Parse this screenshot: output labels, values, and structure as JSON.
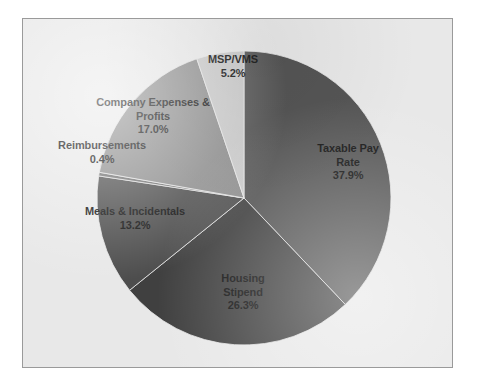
{
  "chart_data": {
    "type": "pie",
    "title": "",
    "subtitle": "",
    "xlabel": "",
    "ylabel": "",
    "legend_position": "none",
    "grid": false,
    "labels_inside": true,
    "start_angle_deg": 0,
    "direction": "clockwise",
    "categories": [
      "Taxable Pay Rate",
      "Housing Stipend",
      "Meals & Incidentals",
      "Reimbursements",
      "Company Expenses & Profits",
      "MSP/VMS"
    ],
    "values": [
      37.9,
      26.3,
      13.2,
      0.4,
      17.0,
      5.2
    ],
    "units": "percent",
    "slices": [
      {
        "name": "Taxable Pay Rate",
        "label_lines": [
          "Taxable Pay",
          "Rate"
        ],
        "value": 37.9,
        "value_text": "37.9%",
        "color": "#555555"
      },
      {
        "name": "Housing Stipend",
        "label_lines": [
          "Housing",
          "Stipend"
        ],
        "value": 26.3,
        "value_text": "26.3%",
        "color": "#404040"
      },
      {
        "name": "Meals & Incidentals",
        "label_lines": [
          "Meals & Incidentals"
        ],
        "value": 13.2,
        "value_text": "13.2%",
        "color": "#4d4d4d"
      },
      {
        "name": "Reimbursements",
        "label_lines": [
          "Reimbursements"
        ],
        "value": 0.4,
        "value_text": "0.4%",
        "color": "#6e6e6e"
      },
      {
        "name": "Company Expenses & Profits",
        "label_lines": [
          "Company Expenses &",
          "Profits"
        ],
        "value": 17.0,
        "value_text": "17.0%",
        "color": "#8c8c8c"
      },
      {
        "name": "MSP/VMS",
        "label_lines": [
          "MSP/VMS"
        ],
        "value": 5.2,
        "value_text": "5.2%",
        "color": "#c9c9c9"
      }
    ]
  },
  "labels": {
    "msp": {
      "l1": "MSP/VMS",
      "l2": "5.2%"
    },
    "company": {
      "l1": "Company Expenses &",
      "l2": "Profits",
      "l3": "17.0%"
    },
    "reimbursements": {
      "l1": "Reimbursements",
      "l2": "0.4%"
    },
    "meals": {
      "l1": "Meals & Incidentals",
      "l2": "13.2%"
    },
    "housing": {
      "l1": "Housing",
      "l2": "Stipend",
      "l3": "26.3%"
    },
    "taxable": {
      "l1": "Taxable Pay",
      "l2": "Rate",
      "l3": "37.9%"
    }
  },
  "colors": {
    "page_background": "#ffffff",
    "plot_background": "#e8e8e8",
    "frame_border": "#9a9a9a",
    "label_text": "#111111"
  }
}
